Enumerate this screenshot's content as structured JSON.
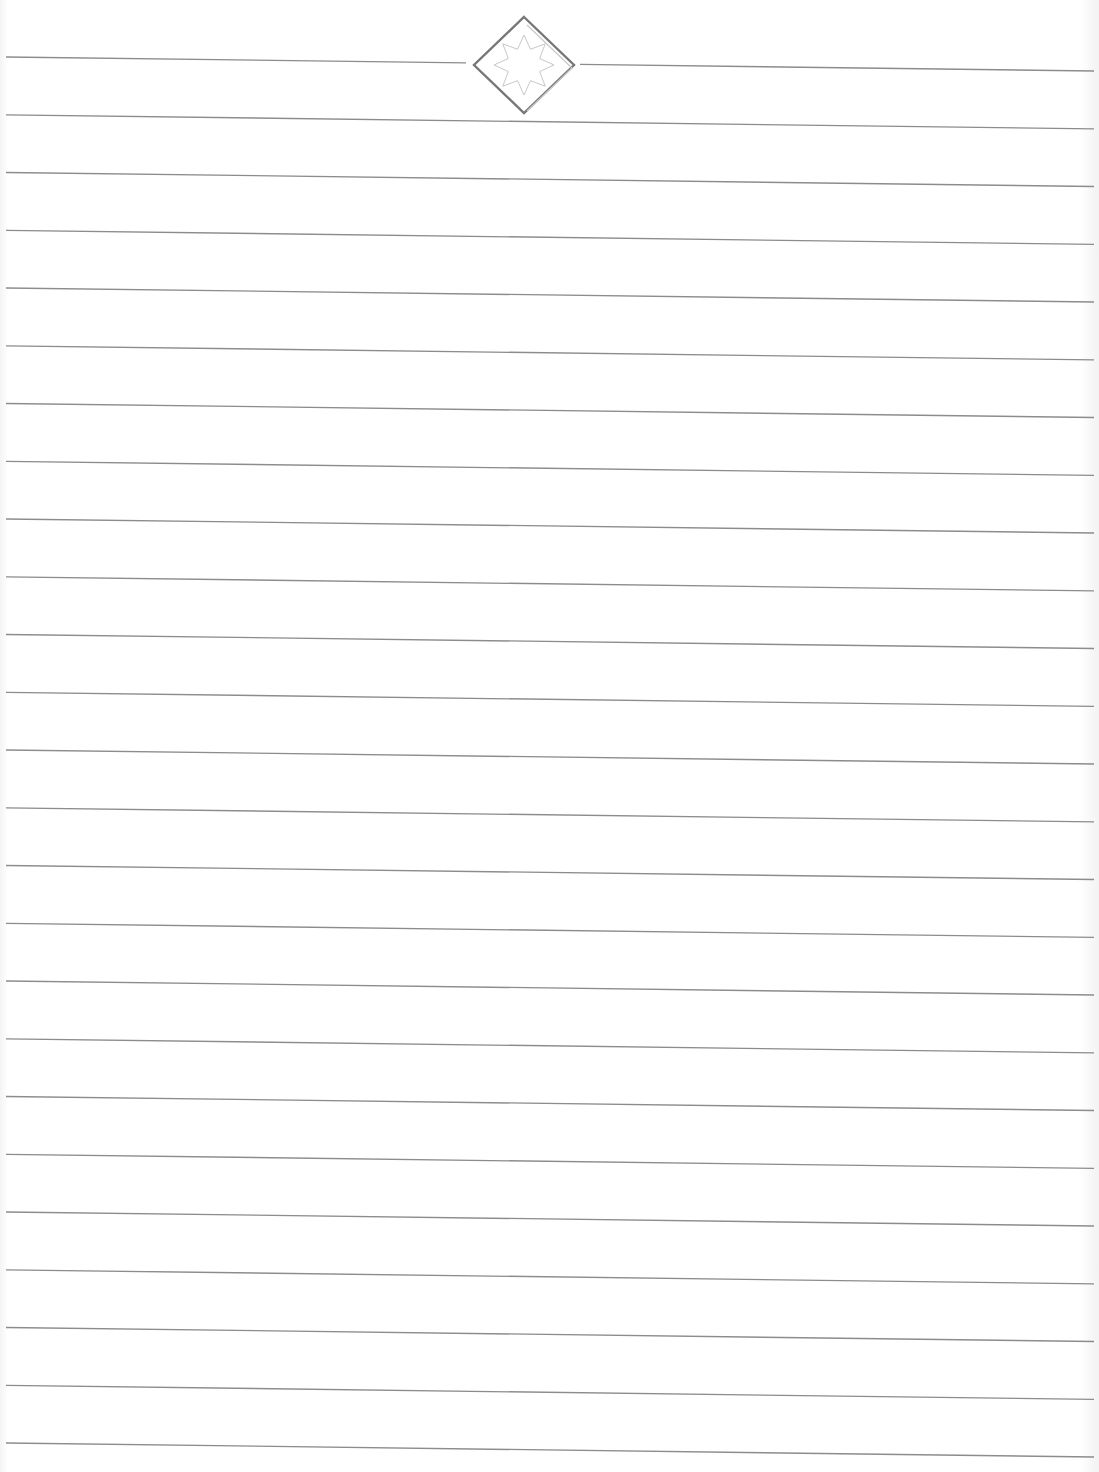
{
  "document": {
    "type": "lined-paper",
    "title": "",
    "line_count": 25,
    "line_spacing_px": 57.75,
    "first_line_y_left": 57,
    "line_slope_px": 14,
    "line_start_x": 6,
    "line_end_x": 1094,
    "ornament": {
      "icon": "diamond-star-ornament-icon",
      "center_x": 524,
      "center_y": 65,
      "half_width": 50,
      "half_height": 48,
      "gap_left_x": 466,
      "gap_right_x": 580
    },
    "colors": {
      "background": "#ffffff",
      "rule": "#8c8c8c",
      "ornament_outer": "#777777",
      "ornament_inner": "#c8c8c8"
    }
  }
}
